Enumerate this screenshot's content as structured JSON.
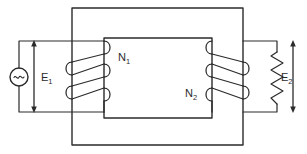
{
  "diagram": {
    "type": "electrical-schematic",
    "background_color": "#ffffff",
    "line_color": "#2b2b2b",
    "labels": {
      "primary_voltage": "E",
      "primary_voltage_sub": "1",
      "secondary_voltage": "E",
      "secondary_voltage_sub": "2",
      "primary_turns": "N",
      "primary_turns_sub": "1",
      "secondary_turns": "N",
      "secondary_turns_sub": "2"
    },
    "components": {
      "ac_source": {
        "name": "ac-voltage-source",
        "symbol": "~",
        "center_x": 19,
        "center_y": 77,
        "radius": 9
      },
      "load_resistor": {
        "name": "load-resistor",
        "x": 277,
        "y_top": 52,
        "y_bottom": 104,
        "zigzags": 7,
        "amplitude": 6
      },
      "core": {
        "name": "transformer-core",
        "outer": {
          "x": 72,
          "y": 8,
          "width": 171,
          "height": 137
        },
        "inner": {
          "x": 104,
          "y": 38,
          "width": 108,
          "height": 80
        }
      },
      "primary_winding": {
        "name": "primary-winding",
        "turns": 3,
        "leg_x_left": 72,
        "leg_x_right": 104
      },
      "secondary_winding": {
        "name": "secondary-winding",
        "turns": 3,
        "leg_x_left": 212,
        "leg_x_right": 243
      }
    },
    "arrows": {
      "primary": {
        "name": "primary-voltage-arrow",
        "x": 34,
        "y_top": 41,
        "y_bottom": 112
      },
      "secondary": {
        "name": "secondary-voltage-arrow",
        "x": 293,
        "y_top": 41,
        "y_bottom": 112
      }
    }
  }
}
